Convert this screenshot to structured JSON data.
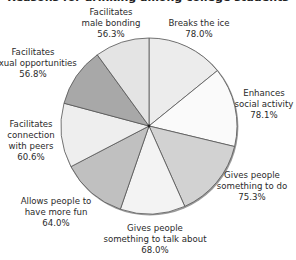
{
  "chart_data": {
    "type": "pie",
    "title": "",
    "title_note": "title text cut off at top edge of image",
    "categories": [
      "Breaks the ice",
      "Enhances social activity",
      "Gives people something to do",
      "Gives people something to talk about",
      "Allows people to have more fun",
      "Facilitates connection with peers",
      "Facilitates sexual opportunities",
      "Facilitates male bonding"
    ],
    "values": [
      78.0,
      78.1,
      75.3,
      68.0,
      64.0,
      60.6,
      56.8,
      56.3
    ],
    "value_labels": [
      "78.0%",
      "78.1%",
      "75.3%",
      "68.0%",
      "64.0%",
      "60.6%",
      "56.8%",
      "56.3%"
    ],
    "start_angle_deg": 0,
    "direction": "clockwise",
    "legend": "none (direct labels)"
  },
  "pie": {
    "cx": 149,
    "cy": 126,
    "r": 88,
    "stroke": "#555555",
    "slices": [
      {
        "start": 0,
        "end": 51,
        "color": "#ececec"
      },
      {
        "start": 51,
        "end": 103.5,
        "color": "#fafafa"
      },
      {
        "start": 103.5,
        "end": 156,
        "color": "#d2d2d2"
      },
      {
        "start": 156,
        "end": 199,
        "color": "#f3f3f3"
      },
      {
        "start": 199,
        "end": 242.5,
        "color": "#c0c0c0"
      },
      {
        "start": 242.5,
        "end": 285,
        "color": "#eeeeee"
      },
      {
        "start": 285,
        "end": 324,
        "color": "#a8a8a8"
      },
      {
        "start": 324,
        "end": 360,
        "color": "#e4e4e4"
      }
    ]
  },
  "labels": [
    {
      "lines": [
        "Breaks the ice",
        "78.0%"
      ],
      "x": 199,
      "y": 18
    },
    {
      "lines": [
        "Enhances",
        "social activity",
        "78.1%"
      ],
      "x": 264,
      "y": 88
    },
    {
      "lines": [
        "Gives people",
        "something to do",
        "75.3%"
      ],
      "x": 252,
      "y": 170
    },
    {
      "lines": [
        "Gives people",
        "something to talk about",
        "68.0%"
      ],
      "x": 155,
      "y": 223
    },
    {
      "lines": [
        "Allows people to",
        "have more fun",
        "64.0%"
      ],
      "x": 56,
      "y": 196
    },
    {
      "lines": [
        "Facilitates",
        "connection",
        "with peers",
        "60.6%"
      ],
      "x": 31,
      "y": 119
    },
    {
      "lines": [
        "Facilitates",
        "sexual opportunities",
        "56.8%"
      ],
      "x": 33,
      "y": 47
    },
    {
      "lines": [
        "Facilitates",
        "male bonding",
        "56.3%"
      ],
      "x": 111,
      "y": 7
    }
  ]
}
